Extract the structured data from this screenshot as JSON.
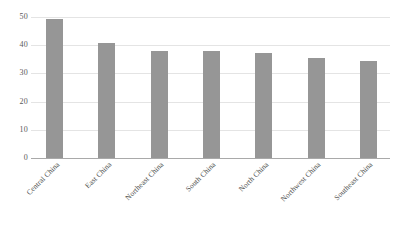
{
  "chart_data": {
    "type": "bar",
    "title": "",
    "subtitle": "",
    "xlabel": "",
    "ylabel": "",
    "categories": [
      "Central China",
      "East China",
      "Northeast China",
      "South China",
      "North China",
      "Northwest China",
      "Southeast China"
    ],
    "values": [
      49.3,
      40.8,
      38.0,
      38.0,
      37.2,
      35.3,
      34.5
    ],
    "ylim": [
      0,
      50
    ],
    "yticks": [
      0,
      10,
      20,
      30,
      40,
      50
    ],
    "ytick_labels": [
      "0",
      "10",
      "20",
      "30",
      "40",
      "50"
    ],
    "grid": true,
    "grid_axis": "y",
    "legend": false,
    "legend_position": "none",
    "bar_color": "#969696",
    "gridline_color": "#e4e4e4",
    "axis_color": "#a9a9a9",
    "tick_label_color": "#595959",
    "category_label_color": "#4d4d4d",
    "background_color": "#ffffff",
    "category_label_rotation": -45
  }
}
